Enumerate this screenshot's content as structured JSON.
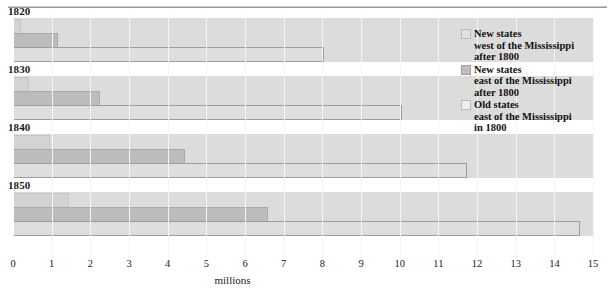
{
  "chart_data": {
    "type": "bar",
    "orientation": "horizontal",
    "title": "",
    "xlabel": "millions",
    "ylabel": "",
    "xlim": [
      0,
      15
    ],
    "xticks": [
      "0",
      "1",
      "2",
      "3",
      "4",
      "5",
      "6",
      "7",
      "8",
      "9",
      "10",
      "11",
      "12",
      "13",
      "14",
      "15"
    ],
    "grid": true,
    "legend_position": "right",
    "categories": [
      "1820",
      "1830",
      "1840",
      "1850"
    ],
    "series": [
      {
        "name": "New states west of the Mississippi after 1800",
        "key": "light",
        "color": "#d3d3d3",
        "values": [
          0.15,
          0.35,
          0.9,
          1.4
        ]
      },
      {
        "name": "New states east of the Mississippi after 1800",
        "key": "medium",
        "color": "#bcbcbc",
        "values": [
          1.1,
          2.2,
          4.4,
          6.55
        ]
      },
      {
        "name": "Old states east of the Mississippi in 1800",
        "key": "outline",
        "color": "#dedede",
        "values": [
          8.0,
          10.0,
          11.7,
          14.6
        ]
      }
    ]
  },
  "groups": [
    {
      "label": "1820",
      "bars": [
        0.15,
        1.1,
        8.0
      ]
    },
    {
      "label": "1830",
      "bars": [
        0.35,
        2.2,
        10.0
      ]
    },
    {
      "label": "1840",
      "bars": [
        0.9,
        4.4,
        11.7
      ]
    },
    {
      "label": "1850",
      "bars": [
        1.4,
        6.55,
        14.6
      ]
    }
  ],
  "axis": {
    "title": "millions",
    "ticks": [
      "0",
      "1",
      "2",
      "3",
      "4",
      "5",
      "6",
      "7",
      "8",
      "9",
      "10",
      "11",
      "12",
      "13",
      "14",
      "15"
    ]
  },
  "legend": {
    "items": [
      {
        "swatch": "light",
        "lines": [
          "New states",
          "west of the Mississippi",
          "after 1800"
        ]
      },
      {
        "swatch": "medium",
        "lines": [
          "New states",
          "east of the Mississippi",
          "after 1800"
        ]
      },
      {
        "swatch": "outline",
        "lines": [
          "Old states",
          "east of the Mississippi",
          "in 1800"
        ]
      }
    ]
  }
}
